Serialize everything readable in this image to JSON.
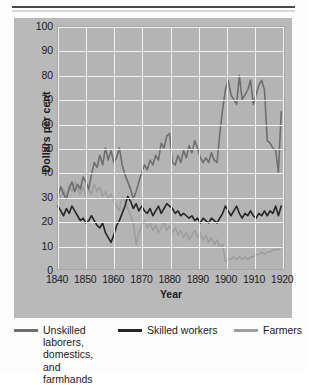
{
  "figure": {
    "clipped_caption": "",
    "top_rule": "divider"
  },
  "chart_data": {
    "type": "line",
    "title": "",
    "xlabel": "Year",
    "ylabel": "Dollars per cent",
    "xlim": [
      1840,
      1921
    ],
    "ylim": [
      0,
      100
    ],
    "ytick_labels": [
      "0",
      "10",
      "20",
      "30",
      "40",
      "50",
      "60",
      "70",
      "80",
      "90",
      "100"
    ],
    "ytick_values": [
      0,
      10,
      20,
      30,
      40,
      50,
      60,
      70,
      80,
      90,
      100
    ],
    "xtick_labels": [
      "1840",
      "1850",
      "1860",
      "1870",
      "1880",
      "1890",
      "1900",
      "1910",
      "1920"
    ],
    "xtick_values": [
      1840,
      1850,
      1860,
      1870,
      1880,
      1890,
      1900,
      1910,
      1920
    ],
    "grid": true,
    "grid_color": "#f2f2f2",
    "plot_background": "#b4b4b4",
    "legend_position": "below",
    "series": [
      {
        "name": "Unskilled laborers, domestics, and farmhands",
        "legend_label": "Unskilled\nlaborers,\ndomestics,\nand farmhands",
        "color": "#6e6e6e",
        "x": [
          1840,
          1841,
          1842,
          1843,
          1844,
          1845,
          1846,
          1847,
          1848,
          1849,
          1850,
          1851,
          1852,
          1853,
          1854,
          1855,
          1856,
          1857,
          1858,
          1859,
          1860,
          1861,
          1862,
          1863,
          1864,
          1865,
          1866,
          1867,
          1868,
          1869,
          1870,
          1871,
          1872,
          1873,
          1874,
          1875,
          1876,
          1877,
          1878,
          1879,
          1880,
          1881,
          1882,
          1883,
          1884,
          1885,
          1886,
          1887,
          1888,
          1889,
          1890,
          1891,
          1892,
          1893,
          1894,
          1895,
          1896,
          1897,
          1898,
          1899,
          1900,
          1901,
          1902,
          1903,
          1904,
          1905,
          1906,
          1907,
          1908,
          1909,
          1910,
          1911,
          1912,
          1913,
          1914,
          1915,
          1916,
          1917,
          1918,
          1919,
          1920
        ],
        "values": [
          30,
          34,
          31,
          29,
          33,
          36,
          32,
          35,
          33,
          38,
          36,
          33,
          39,
          44,
          42,
          47,
          43,
          50,
          45,
          49,
          44,
          46,
          50,
          43,
          39,
          36,
          33,
          29,
          32,
          36,
          40,
          43,
          41,
          45,
          43,
          47,
          45,
          52,
          50,
          55,
          56,
          44,
          43,
          47,
          44,
          49,
          46,
          51,
          48,
          53,
          50,
          46,
          44,
          46,
          44,
          48,
          45,
          44,
          56,
          66,
          74,
          78,
          72,
          70,
          68,
          80,
          70,
          72,
          74,
          78,
          68,
          72,
          76,
          78,
          74,
          53,
          52,
          50,
          49,
          40,
          65
        ]
      },
      {
        "name": "Skilled workers",
        "legend_label": "Skilled workers",
        "color": "#262626",
        "x": [
          1840,
          1841,
          1842,
          1843,
          1844,
          1845,
          1846,
          1847,
          1848,
          1849,
          1850,
          1851,
          1852,
          1853,
          1854,
          1855,
          1856,
          1857,
          1858,
          1859,
          1860,
          1861,
          1862,
          1863,
          1864,
          1865,
          1866,
          1867,
          1868,
          1869,
          1870,
          1871,
          1872,
          1873,
          1874,
          1875,
          1876,
          1877,
          1878,
          1879,
          1880,
          1881,
          1882,
          1883,
          1884,
          1885,
          1886,
          1887,
          1888,
          1889,
          1890,
          1891,
          1892,
          1893,
          1894,
          1895,
          1896,
          1897,
          1898,
          1899,
          1900,
          1901,
          1902,
          1903,
          1904,
          1905,
          1906,
          1907,
          1908,
          1909,
          1910,
          1911,
          1912,
          1913,
          1914,
          1915,
          1916,
          1917,
          1918,
          1919,
          1920
        ],
        "values": [
          26,
          24,
          22,
          25,
          23,
          26,
          24,
          22,
          20,
          21,
          19,
          20,
          22,
          20,
          18,
          17,
          19,
          15,
          13,
          11,
          14,
          18,
          20,
          23,
          26,
          30,
          28,
          25,
          27,
          24,
          26,
          24,
          23,
          25,
          22,
          24,
          26,
          23,
          25,
          27,
          26,
          25,
          23,
          24,
          22,
          23,
          22,
          21,
          22,
          20,
          21,
          19,
          21,
          20,
          19,
          21,
          20,
          19,
          21,
          23,
          26,
          24,
          22,
          24,
          26,
          23,
          21,
          23,
          22,
          24,
          22,
          21,
          23,
          22,
          24,
          22,
          24,
          23,
          26,
          22,
          26
        ]
      },
      {
        "name": "Farmers",
        "legend_label": "Farmers",
        "color": "#9e9e9e",
        "x": [
          1840,
          1841,
          1842,
          1843,
          1844,
          1845,
          1846,
          1847,
          1848,
          1849,
          1850,
          1851,
          1852,
          1853,
          1854,
          1855,
          1856,
          1857,
          1858,
          1859,
          1860,
          1861,
          1862,
          1863,
          1864,
          1865,
          1866,
          1867,
          1868,
          1869,
          1870,
          1871,
          1872,
          1873,
          1874,
          1875,
          1876,
          1877,
          1878,
          1879,
          1880,
          1881,
          1882,
          1883,
          1884,
          1885,
          1886,
          1887,
          1888,
          1889,
          1890,
          1891,
          1892,
          1893,
          1894,
          1895,
          1896,
          1897,
          1898,
          1899,
          1900,
          1901,
          1902,
          1903,
          1904,
          1905,
          1906,
          1907,
          1908,
          1909,
          1910,
          1911,
          1912,
          1913,
          1914,
          1915,
          1916,
          1917,
          1918,
          1919,
          1920
        ],
        "values": [
          31,
          29,
          33,
          30,
          35,
          32,
          36,
          33,
          31,
          34,
          30,
          33,
          31,
          35,
          32,
          34,
          30,
          32,
          29,
          31,
          28,
          26,
          24,
          30,
          28,
          25,
          22,
          19,
          10,
          15,
          18,
          20,
          17,
          19,
          16,
          18,
          15,
          17,
          19,
          16,
          18,
          15,
          17,
          14,
          16,
          13,
          15,
          12,
          14,
          16,
          13,
          15,
          12,
          14,
          11,
          13,
          10,
          12,
          9,
          10,
          3,
          4,
          4,
          5,
          4,
          5,
          4,
          5,
          4,
          5,
          5,
          6,
          6,
          7,
          6,
          7,
          7,
          8,
          8,
          8,
          9
        ]
      }
    ]
  },
  "legend": {
    "items": [
      {
        "label": "Unskilled\nlaborers,\ndomestics,\nand farmhands",
        "color": "#6e6e6e"
      },
      {
        "label": "Skilled workers",
        "color": "#262626"
      },
      {
        "label": "Farmers",
        "color": "#9e9e9e"
      }
    ]
  }
}
